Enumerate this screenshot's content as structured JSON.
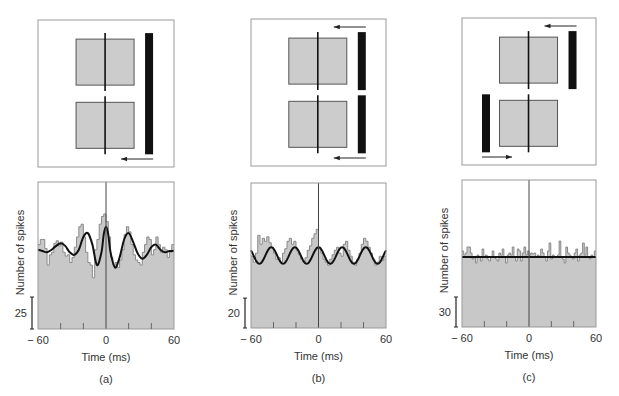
{
  "figure": {
    "colors": {
      "histogram_fill": "#c8c8c8",
      "histogram_edge": "#8a8a8a",
      "stimulus_square": "#cccccc",
      "bar": "#111111",
      "fit_line": "#111111",
      "frame": "#999999"
    }
  },
  "chart_data": [
    {
      "type": "bar",
      "panel_label": "(a)",
      "title": "",
      "xlabel": "Time (ms)",
      "ylabel": "Number of spikes",
      "xlim": [
        -60,
        60
      ],
      "ylim": [
        0,
        115
      ],
      "x_tick_labels": [
        "− 60",
        "0",
        "60"
      ],
      "x_ticks": [
        -60,
        0,
        60
      ],
      "minor_ticks": [
        -40,
        -20,
        20,
        40
      ],
      "scale_bar": {
        "value": 25,
        "label": "25"
      },
      "bin_width_ms": 2,
      "x": [
        -59,
        -57,
        -55,
        -53,
        -51,
        -49,
        -47,
        -45,
        -43,
        -41,
        -39,
        -37,
        -35,
        -33,
        -31,
        -29,
        -27,
        -25,
        -23,
        -21,
        -19,
        -17,
        -15,
        -13,
        -11,
        -9,
        -7,
        -5,
        -3,
        -1,
        1,
        3,
        5,
        7,
        9,
        11,
        13,
        15,
        17,
        19,
        21,
        23,
        25,
        27,
        29,
        31,
        33,
        35,
        37,
        39,
        41,
        43,
        45,
        47,
        49,
        51,
        53,
        55,
        57,
        59
      ],
      "values": [
        66,
        70,
        70,
        63,
        50,
        58,
        60,
        67,
        69,
        65,
        68,
        60,
        57,
        58,
        52,
        56,
        64,
        72,
        80,
        82,
        72,
        60,
        52,
        50,
        40,
        62,
        70,
        82,
        88,
        90,
        84,
        72,
        56,
        50,
        52,
        48,
        54,
        62,
        74,
        80,
        76,
        66,
        58,
        54,
        52,
        50,
        60,
        66,
        72,
        70,
        58,
        62,
        72,
        66,
        60,
        64,
        62,
        56,
        60,
        66
      ],
      "fit": {
        "description": "damped oscillation",
        "baseline": 62,
        "x": [
          -60,
          -56,
          -52,
          -48,
          -44,
          -40,
          -36,
          -32,
          -28,
          -24,
          -20,
          -16,
          -12,
          -8,
          -4,
          -2,
          0,
          2,
          4,
          8,
          12,
          16,
          20,
          24,
          28,
          32,
          36,
          40,
          44,
          48,
          52,
          56,
          60
        ],
        "y": [
          62,
          61,
          60,
          62,
          65,
          67,
          65,
          60,
          58,
          62,
          72,
          75,
          66,
          50,
          60,
          74,
          80,
          74,
          60,
          48,
          56,
          70,
          75,
          68,
          59,
          55,
          58,
          64,
          66,
          62,
          60,
          61,
          61
        ]
      },
      "stimulus": {
        "description": "two squares with vertical receptive-field line; one long continuous bar on the right moving left",
        "squares": 2,
        "bars": [
          {
            "side": "right",
            "extent": "both squares",
            "arrow": "left",
            "arrow_position": "bottom"
          }
        ]
      }
    },
    {
      "type": "bar",
      "panel_label": "(b)",
      "title": "",
      "xlabel": "Time (ms)",
      "ylabel": "Number of spikes",
      "xlim": [
        -60,
        60
      ],
      "ylim": [
        0,
        97
      ],
      "x_tick_labels": [
        "− 60",
        "0",
        "60"
      ],
      "x_ticks": [
        -60,
        0,
        60
      ],
      "minor_ticks": [
        -40,
        -20,
        20,
        40
      ],
      "scale_bar": {
        "value": 20,
        "label": "20"
      },
      "bin_width_ms": 2,
      "x": [
        -59,
        -57,
        -55,
        -53,
        -51,
        -49,
        -47,
        -45,
        -43,
        -41,
        -39,
        -37,
        -35,
        -33,
        -31,
        -29,
        -27,
        -25,
        -23,
        -21,
        -19,
        -17,
        -15,
        -13,
        -11,
        -9,
        -7,
        -5,
        -3,
        -1,
        1,
        3,
        5,
        7,
        9,
        11,
        13,
        15,
        17,
        19,
        21,
        23,
        25,
        27,
        29,
        31,
        33,
        35,
        37,
        39,
        41,
        43,
        45,
        47,
        49,
        51,
        53,
        55,
        57,
        59
      ],
      "values": [
        48,
        44,
        50,
        62,
        56,
        60,
        58,
        61,
        57,
        54,
        50,
        46,
        47,
        44,
        50,
        53,
        58,
        60,
        56,
        58,
        52,
        49,
        46,
        44,
        47,
        52,
        55,
        60,
        63,
        66,
        54,
        50,
        46,
        44,
        42,
        46,
        49,
        52,
        54,
        50,
        48,
        56,
        58,
        52,
        48,
        44,
        42,
        46,
        50,
        56,
        60,
        58,
        54,
        50,
        46,
        42,
        44,
        48,
        45,
        48
      ],
      "fit": {
        "description": "sinusoid, period ~20 ms",
        "baseline": 48.5,
        "amplitude": 5.5,
        "period_ms": 21,
        "peak_at_ms": 0
      },
      "stimulus": {
        "description": "two squares with vertical receptive-field line; two separate bars on the right, both moving left",
        "squares": 2,
        "bars": [
          {
            "side": "right",
            "extent": "top square",
            "arrow": "left",
            "arrow_position": "top"
          },
          {
            "side": "right",
            "extent": "bottom square",
            "arrow": "left",
            "arrow_position": "bottom"
          }
        ]
      }
    },
    {
      "type": "bar",
      "panel_label": "(c)",
      "title": "",
      "xlabel": "Time (ms)",
      "ylabel": "Number of spikes",
      "xlim": [
        -60,
        60
      ],
      "ylim": [
        0,
        147
      ],
      "x_tick_labels": [
        "− 60",
        "0",
        "60"
      ],
      "x_ticks": [
        -60,
        0,
        60
      ],
      "minor_ticks": [
        -40,
        -20,
        20,
        40
      ],
      "scale_bar": {
        "value": 30,
        "label": "30"
      },
      "bin_width_ms": 1.5,
      "x": [
        -59.25,
        -57.75,
        -56.25,
        -54.75,
        -53.25,
        -51.75,
        -50.25,
        -48.75,
        -47.25,
        -45.75,
        -44.25,
        -42.75,
        -41.25,
        -39.75,
        -38.25,
        -36.75,
        -35.25,
        -33.75,
        -32.25,
        -30.75,
        -29.25,
        -27.75,
        -26.25,
        -24.75,
        -23.25,
        -21.75,
        -20.25,
        -18.75,
        -17.25,
        -15.75,
        -14.25,
        -12.75,
        -11.25,
        -9.75,
        -8.25,
        -6.75,
        -5.25,
        -3.75,
        -2.25,
        -0.75,
        0.75,
        2.25,
        3.75,
        5.25,
        6.75,
        8.25,
        9.75,
        11.25,
        12.75,
        14.25,
        15.75,
        17.25,
        18.75,
        20.25,
        21.75,
        23.25,
        24.75,
        26.25,
        27.75,
        29.25,
        30.75,
        32.25,
        33.75,
        35.25,
        36.75,
        38.25,
        39.75,
        41.25,
        42.75,
        44.25,
        45.75,
        47.25,
        48.75,
        50.25,
        51.75,
        53.25,
        54.75,
        56.25,
        57.75,
        59.25
      ],
      "values": [
        76,
        72,
        74,
        80,
        80,
        74,
        68,
        70,
        64,
        72,
        70,
        66,
        78,
        70,
        72,
        68,
        66,
        70,
        76,
        70,
        68,
        66,
        74,
        72,
        78,
        70,
        64,
        72,
        74,
        72,
        80,
        70,
        66,
        78,
        76,
        66,
        74,
        80,
        72,
        76,
        72,
        74,
        73,
        74,
        70,
        72,
        70,
        78,
        74,
        70,
        66,
        76,
        84,
        68,
        72,
        70,
        70,
        72,
        86,
        70,
        68,
        64,
        80,
        74,
        72,
        70,
        68,
        74,
        78,
        66,
        72,
        74,
        84,
        72,
        80,
        70,
        68,
        72,
        70,
        76
      ],
      "fit": {
        "description": "flat line",
        "baseline": 70
      },
      "stimulus": {
        "description": "two squares with vertical receptive-field line; top bar on right moving left, bottom bar on left moving right (opposite directions)",
        "squares": 2,
        "bars": [
          {
            "side": "right",
            "extent": "top square",
            "arrow": "left",
            "arrow_position": "top"
          },
          {
            "side": "left",
            "extent": "bottom square",
            "arrow": "right",
            "arrow_position": "bottom"
          }
        ]
      }
    }
  ]
}
